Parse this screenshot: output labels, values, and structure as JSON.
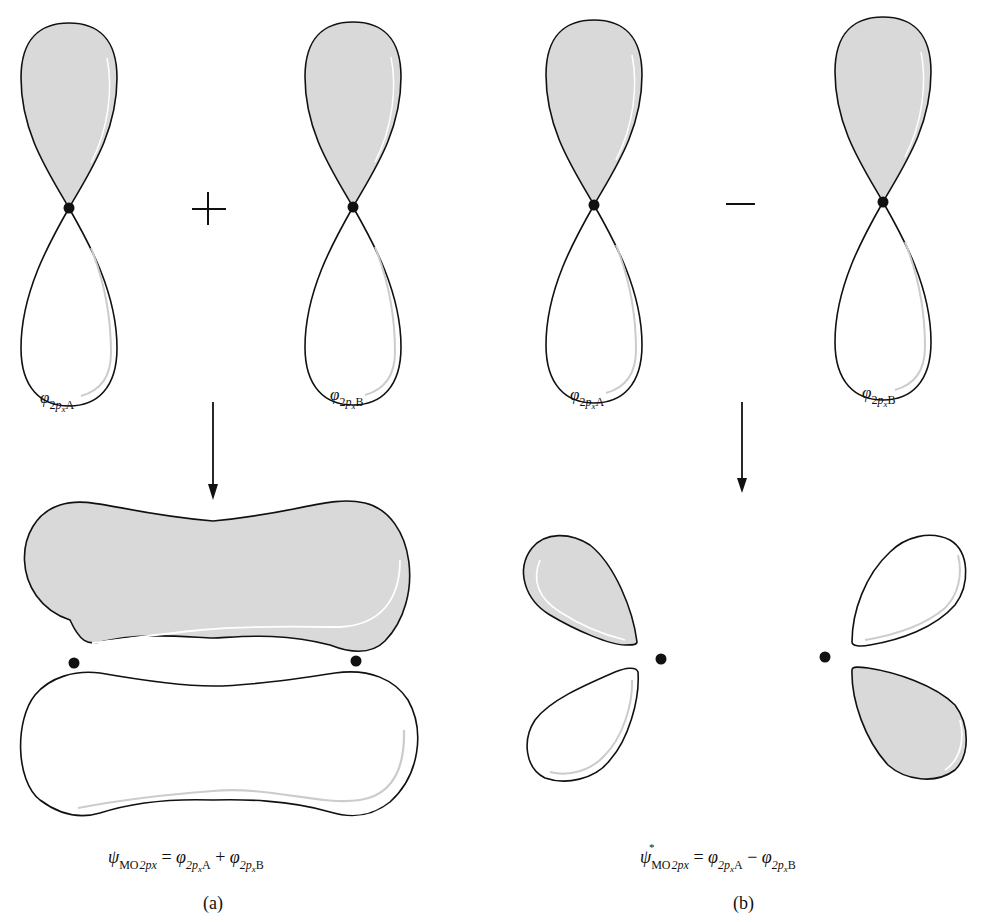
{
  "colors": {
    "positive_lobe_fill": "#d9d9d9",
    "negative_lobe_fill": "#ffffff",
    "outline": "#111111",
    "nucleus": "#111111"
  },
  "panel_a": {
    "operator": "+",
    "orbital_A": {
      "symbol": "φ",
      "sub_prefix": "2",
      "sub_p": "p",
      "sub_x": "x",
      "sub_atom": "A"
    },
    "orbital_B": {
      "symbol": "φ",
      "sub_prefix": "2",
      "sub_p": "p",
      "sub_x": "x",
      "sub_atom": "B"
    },
    "equation": {
      "lhs_symbol": "ψ",
      "lhs_sub_up": "MO",
      "lhs_sub_it": "2px",
      "equals": "=",
      "term1_symbol": "φ",
      "term1_sub_it": "2p",
      "term1_sub_x": "x",
      "term1_atom": "A",
      "operator": "+",
      "term2_symbol": "φ",
      "term2_sub_it": "2p",
      "term2_sub_x": "x",
      "term2_atom": "B"
    },
    "caption": "(a)",
    "result_description": "bonding π molecular orbital (shaded upper lobe, unshaded lower lobe)"
  },
  "panel_b": {
    "operator": "−",
    "orbital_A": {
      "symbol": "φ",
      "sub_prefix": "2",
      "sub_p": "p",
      "sub_x": "x",
      "sub_atom": "A"
    },
    "orbital_B": {
      "symbol": "φ",
      "sub_prefix": "2",
      "sub_p": "p",
      "sub_x": "x",
      "sub_atom": "B"
    },
    "equation": {
      "lhs_symbol": "ψ",
      "lhs_star": "*",
      "lhs_sub_up": "MO",
      "lhs_sub_it": "2px",
      "equals": "=",
      "term1_symbol": "φ",
      "term1_sub_it": "2p",
      "term1_sub_x": "x",
      "term1_atom": "A",
      "operator": "−",
      "term2_symbol": "φ",
      "term2_sub_it": "2p",
      "term2_sub_x": "x",
      "term2_atom": "B"
    },
    "caption": "(b)",
    "result_description": "antibonding π* molecular orbital (four lobes, alternating sign)"
  }
}
